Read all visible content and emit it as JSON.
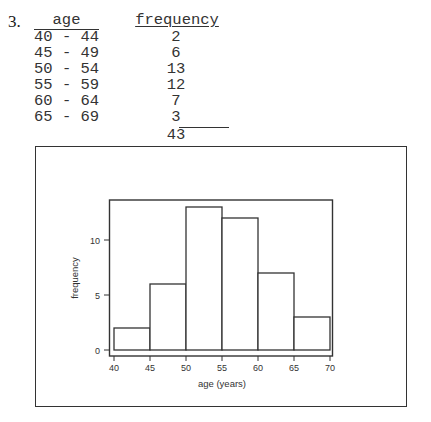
{
  "question_number": "3.",
  "table": {
    "headers": {
      "age": "age",
      "frequency": "frequency"
    },
    "rows": [
      {
        "age": "40 - 44",
        "frequency": "2"
      },
      {
        "age": "45 - 49",
        "frequency": "6"
      },
      {
        "age": "50 - 54",
        "frequency": "13"
      },
      {
        "age": "55 - 59",
        "frequency": "12"
      },
      {
        "age": "60 - 64",
        "frequency": "7"
      },
      {
        "age": "65 - 69",
        "frequency": "3"
      }
    ],
    "total": "43"
  },
  "chart_data": {
    "type": "bar",
    "subtype": "histogram",
    "title": "",
    "xlabel": "age (years)",
    "ylabel": "frequency",
    "bins": [
      [
        40,
        45
      ],
      [
        45,
        50
      ],
      [
        50,
        55
      ],
      [
        55,
        60
      ],
      [
        60,
        65
      ],
      [
        65,
        70
      ]
    ],
    "categories": [
      "40-44",
      "45-49",
      "50-54",
      "55-59",
      "60-64",
      "65-69"
    ],
    "values": [
      2,
      6,
      13,
      12,
      7,
      3
    ],
    "x_ticks": [
      "40",
      "45",
      "50",
      "55",
      "60",
      "65",
      "70"
    ],
    "y_ticks": [
      "0",
      "5",
      "10"
    ],
    "xlim": [
      40,
      70
    ],
    "ylim": [
      0,
      13.5
    ],
    "grid": false,
    "legend": null
  }
}
